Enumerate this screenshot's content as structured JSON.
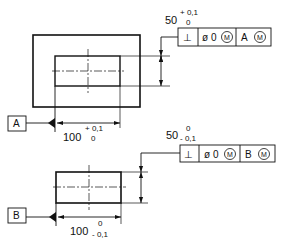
{
  "drawing": {
    "view_a": {
      "dimension_height": {
        "nominal": "50",
        "upper_tol": "+ 0,1",
        "lower_tol": "0"
      },
      "dimension_width": {
        "nominal": "100",
        "upper_tol": "+ 0,1",
        "lower_tol": "0"
      },
      "feature_control_frame": {
        "symbol": "⊥",
        "tolerance": "ø 0",
        "tolerance_modifier": "M",
        "datum": "A",
        "datum_modifier": "M"
      },
      "datum_label": "A"
    },
    "view_b": {
      "dimension_height": {
        "nominal": "50",
        "upper_tol": "0",
        "lower_tol": "- 0,1"
      },
      "dimension_width": {
        "nominal": "100",
        "upper_tol": "0",
        "lower_tol": "- 0,1"
      },
      "feature_control_frame": {
        "symbol": "⊥",
        "tolerance": "ø 0",
        "tolerance_modifier": "M",
        "datum": "B",
        "datum_modifier": "M"
      },
      "datum_label": "B"
    }
  }
}
